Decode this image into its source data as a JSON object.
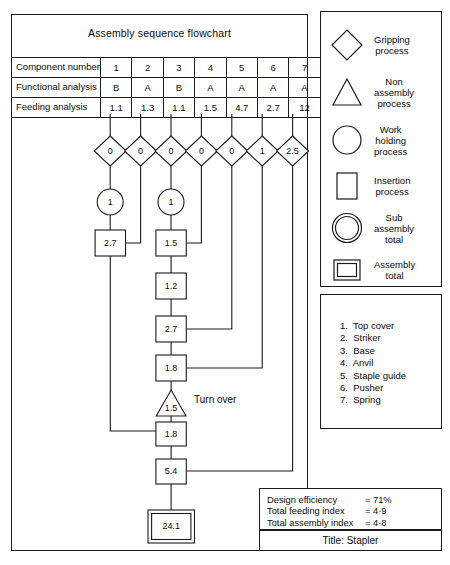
{
  "chart_title": "Assembly sequence flowchart",
  "table": {
    "row_labels": [
      "Component number",
      "Functional analysis",
      "Feeding analysis"
    ],
    "component_numbers": [
      "1",
      "2",
      "3",
      "4",
      "5",
      "6",
      "7"
    ],
    "functional_analysis": [
      "B",
      "A",
      "B",
      "A",
      "A",
      "A",
      "A"
    ],
    "feeding_analysis": [
      "1.1",
      "1.3",
      "1.1",
      "1.5",
      "4.7",
      "2.7",
      "12"
    ]
  },
  "flow": {
    "gripping_values": [
      "0",
      "0",
      "0",
      "0",
      "0",
      "1",
      "2.5"
    ],
    "work_holding_values": [
      "1",
      "1"
    ],
    "insertion_left": "2.7",
    "insertion_chain": [
      "1.5",
      "1.2",
      "2.7",
      "1.8"
    ],
    "turn_over_value": "1.5",
    "turn_over_label": "Turn over",
    "insertion_lower": [
      "1.8",
      "5.4"
    ],
    "assembly_total": "24.1"
  },
  "legend": {
    "items": [
      {
        "symbol": "diamond-icon",
        "label": "Gripping\nprocess"
      },
      {
        "symbol": "triangle-icon",
        "label": "Non\nassembly\nprocess"
      },
      {
        "symbol": "circle-icon",
        "label": "Work\nholding\nprocess"
      },
      {
        "symbol": "rectangle-icon",
        "label": "Insertion\nprocess"
      },
      {
        "symbol": "double-circle-icon",
        "label": "Sub\nassembly\ntotal"
      },
      {
        "symbol": "double-rectangle-icon",
        "label": "Assembly\ntotal"
      }
    ]
  },
  "components": [
    "1.  Top cover",
    "2.  Striker",
    "3.  Base",
    "4.  Anvil",
    "5.  Staple guide",
    "6.  Pusher",
    "7.  Spring"
  ],
  "metrics": [
    {
      "label": "Design efficiency",
      "value": "= 71%"
    },
    {
      "label": "Total feeding index",
      "value": "= 4·9"
    },
    {
      "label": "Total assembly index",
      "value": "= 4·8"
    }
  ],
  "title_bar": "Title: Stapler",
  "chart_data": {
    "type": "diagram",
    "title": "Assembly sequence flowchart",
    "categories": [
      "1",
      "2",
      "3",
      "4",
      "5",
      "6",
      "7"
    ],
    "series": [
      {
        "name": "Functional analysis",
        "values": [
          "B",
          "A",
          "B",
          "A",
          "A",
          "A",
          "A"
        ]
      },
      {
        "name": "Feeding analysis",
        "values": [
          1.1,
          1.3,
          1.1,
          1.5,
          4.7,
          2.7,
          12
        ]
      },
      {
        "name": "Gripping process",
        "values": [
          0,
          0,
          0,
          0,
          0,
          1,
          2.5
        ]
      }
    ],
    "nodes": [
      {
        "id": "wh1",
        "type": "work-holding",
        "value": 1,
        "column": 1
      },
      {
        "id": "wh2",
        "type": "work-holding",
        "value": 1,
        "column": 3
      },
      {
        "id": "ins-left",
        "type": "insertion",
        "value": 2.7,
        "column": 1
      },
      {
        "id": "ins1",
        "type": "insertion",
        "value": 1.5,
        "column": 3
      },
      {
        "id": "ins2",
        "type": "insertion",
        "value": 1.2,
        "column": 3
      },
      {
        "id": "ins3",
        "type": "insertion",
        "value": 2.7,
        "column": 3
      },
      {
        "id": "ins4",
        "type": "insertion",
        "value": 1.8,
        "column": 3
      },
      {
        "id": "turn",
        "type": "non-assembly",
        "value": 1.5,
        "column": 3
      },
      {
        "id": "ins5",
        "type": "insertion",
        "value": 1.8,
        "column": 3
      },
      {
        "id": "ins6",
        "type": "insertion",
        "value": 5.4,
        "column": 3
      },
      {
        "id": "total",
        "type": "assembly-total",
        "value": 24.1,
        "column": 3
      }
    ],
    "edges": [
      {
        "from": "column-2",
        "to": "ins-left"
      },
      {
        "from": "column-4",
        "to": "ins1"
      },
      {
        "from": "column-5",
        "to": "ins3"
      },
      {
        "from": "column-6",
        "to": "ins4"
      },
      {
        "from": "column-7",
        "to": "ins6"
      },
      {
        "from": "ins-left",
        "to": "ins5"
      }
    ],
    "design_efficiency_percent": 71,
    "total_feeding_index": 4.9,
    "total_assembly_index": 4.8
  }
}
